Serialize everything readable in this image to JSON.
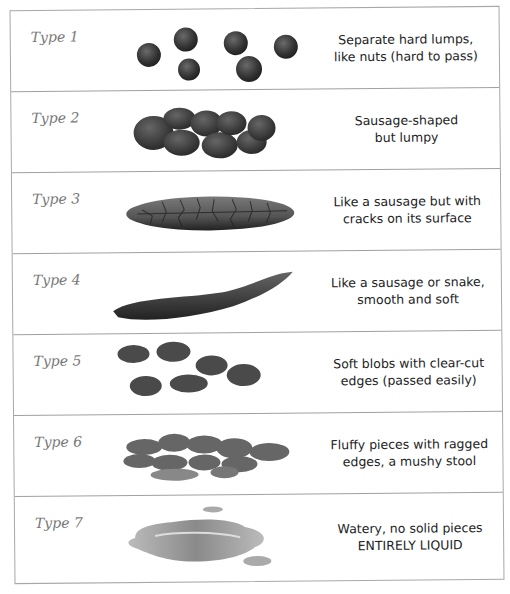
{
  "chart": {
    "rows": [
      {
        "type": "Type 1",
        "line1": "Separate hard lumps,",
        "line2": "like nuts (hard to pass)",
        "illustration": "separate-hard-lumps"
      },
      {
        "type": "Type 2",
        "line1": "Sausage-shaped",
        "line2": "but lumpy",
        "illustration": "lumpy-sausage"
      },
      {
        "type": "Type 3",
        "line1": "Like a sausage but with",
        "line2": "cracks on its surface",
        "illustration": "cracked-sausage"
      },
      {
        "type": "Type 4",
        "line1": "Like a sausage or snake,",
        "line2": "smooth and soft",
        "illustration": "smooth-snake"
      },
      {
        "type": "Type 5",
        "line1": "Soft blobs with clear-cut",
        "line2": "edges (passed easily)",
        "illustration": "soft-blobs"
      },
      {
        "type": "Type 6",
        "line1": "Fluffy pieces with ragged",
        "line2": "edges, a mushy stool",
        "illustration": "fluffy-pieces"
      },
      {
        "type": "Type 7",
        "line1": "Watery, no solid pieces",
        "line2": "ENTIRELY LIQUID",
        "illustration": "watery-puddle"
      }
    ]
  },
  "colors": {
    "border": "#a8a8a8",
    "label": "#777777",
    "text": "#222222",
    "stool_dark": "#3a3a3a",
    "stool_mid": "#5a5a5a",
    "liquid": "#9a9a9a"
  }
}
